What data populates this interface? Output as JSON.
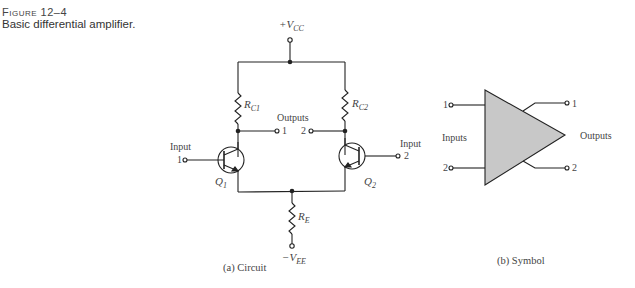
{
  "figure": {
    "number": "Figure 12–4",
    "title": "Basic differential amplifier."
  },
  "circuit": {
    "supply_positive": {
      "sign": "+",
      "main": "V",
      "sub": "CC"
    },
    "supply_negative": {
      "sign": "−",
      "main": "V",
      "sub": "EE"
    },
    "resistors": [
      {
        "main": "R",
        "sub": "C1"
      },
      {
        "main": "R",
        "sub": "C2"
      },
      {
        "main": "R",
        "sub": "E"
      }
    ],
    "transistors": [
      {
        "main": "Q",
        "sub": "1"
      },
      {
        "main": "Q",
        "sub": "2"
      }
    ],
    "outputs_label": "Outputs",
    "output_1": "1",
    "output_2": "2",
    "input_label": "Input",
    "input_1": "1",
    "input_2": "2",
    "caption": "(a) Circuit"
  },
  "symbol": {
    "inputs_label": "Inputs",
    "outputs_label": "Outputs",
    "input_1": "1",
    "input_2": "2",
    "output_1": "1",
    "output_2": "2",
    "fill_color": "#c8c8c8",
    "caption": "(b) Symbol"
  }
}
